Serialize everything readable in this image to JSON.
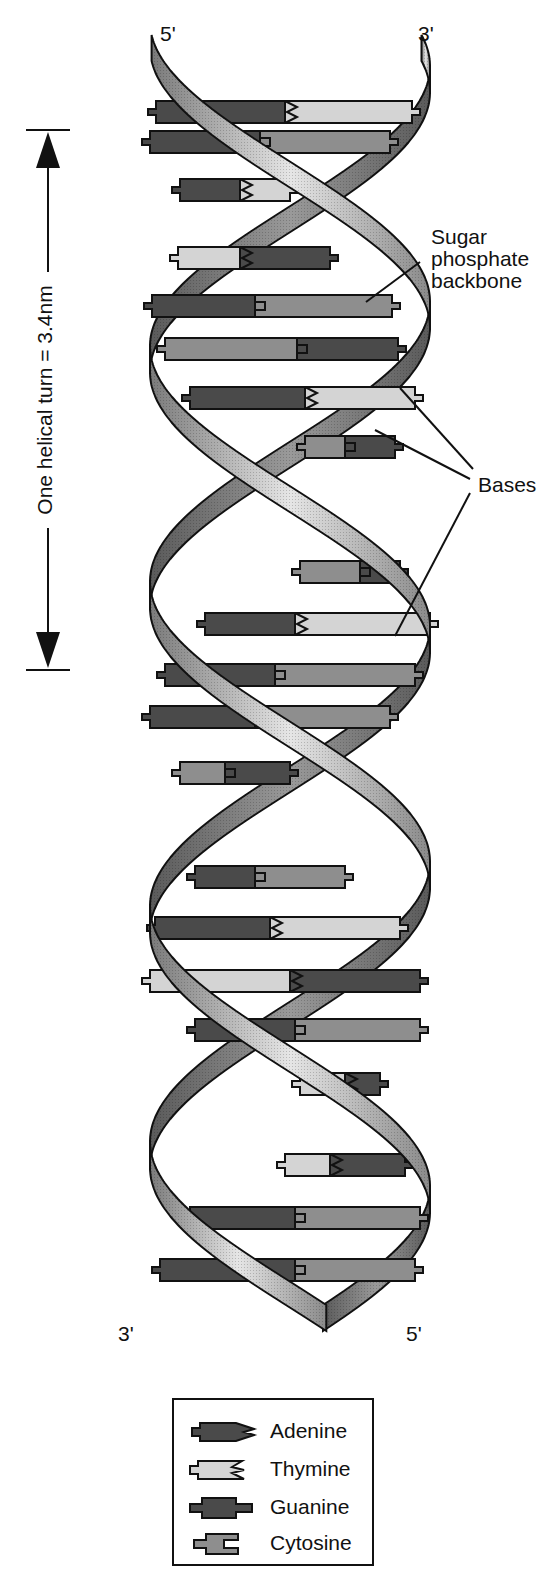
{
  "labels": {
    "top_left_end": "5'",
    "top_right_end": "3'",
    "bottom_left_end": "3'",
    "bottom_right_end": "5'",
    "helical_turn": "One helical turn = 3.4nm",
    "backbone_line1": "Sugar",
    "backbone_line2": "phosphate",
    "backbone_line3": "backbone",
    "bases": "Bases"
  },
  "legend": {
    "items": [
      {
        "name": "Adenine",
        "shape": "adenine"
      },
      {
        "name": "Thymine",
        "shape": "thymine"
      },
      {
        "name": "Guanine",
        "shape": "guanine"
      },
      {
        "name": "Cytosine",
        "shape": "cytosine"
      }
    ]
  },
  "colors": {
    "adenine": "#4a4a4a",
    "thymine": "#d4d4d4",
    "guanine": "#4a4a4a",
    "cytosine": "#8e8e8e",
    "strand_front": "#b9b9b9",
    "strand_back": "#6e6e6e",
    "outline": "#111111"
  },
  "helix": {
    "center_x": 290,
    "amplitude": 140,
    "top_y": 48,
    "bottom_y": 1318,
    "period": 560
  },
  "base_pairs": [
    {
      "y": 112,
      "x1": 156,
      "x2": 412,
      "left": "A",
      "right": "T",
      "split": 285
    },
    {
      "y": 142,
      "x1": 150,
      "x2": 390,
      "left": "G",
      "right": "C",
      "split": 260
    },
    {
      "y": 190,
      "x1": 180,
      "x2": 290,
      "left": "A",
      "right": "T",
      "split": 240
    },
    {
      "y": 258,
      "x1": 178,
      "x2": 330,
      "left": "T",
      "right": "A",
      "split": 240
    },
    {
      "y": 306,
      "x1": 152,
      "x2": 392,
      "left": "G",
      "right": "C",
      "split": 255
    },
    {
      "y": 349,
      "x1": 165,
      "x2": 398,
      "left": "C",
      "right": "G",
      "split": 297
    },
    {
      "y": 398,
      "x1": 190,
      "x2": 415,
      "left": "A",
      "right": "T",
      "split": 305
    },
    {
      "y": 447,
      "x1": 305,
      "x2": 395,
      "left": "C",
      "right": "G",
      "split": 345
    },
    {
      "y": 572,
      "x1": 300,
      "x2": 400,
      "left": "C",
      "right": "G",
      "split": 360
    },
    {
      "y": 624,
      "x1": 205,
      "x2": 430,
      "left": "A",
      "right": "T",
      "split": 295
    },
    {
      "y": 675,
      "x1": 165,
      "x2": 415,
      "left": "G",
      "right": "C",
      "split": 275
    },
    {
      "y": 717,
      "x1": 150,
      "x2": 390,
      "left": "G",
      "right": "C",
      "split": 255
    },
    {
      "y": 773,
      "x1": 180,
      "x2": 290,
      "left": "C",
      "right": "G",
      "split": 225
    },
    {
      "y": 877,
      "x1": 195,
      "x2": 345,
      "left": "G",
      "right": "C",
      "split": 255
    },
    {
      "y": 928,
      "x1": 155,
      "x2": 400,
      "left": "A",
      "right": "T",
      "split": 270
    },
    {
      "y": 981,
      "x1": 150,
      "x2": 420,
      "left": "T",
      "right": "A",
      "split": 290
    },
    {
      "y": 1030,
      "x1": 195,
      "x2": 420,
      "left": "G",
      "right": "C",
      "split": 295
    },
    {
      "y": 1084,
      "x1": 300,
      "x2": 380,
      "left": "T",
      "right": "A",
      "split": 345
    },
    {
      "y": 1165,
      "x1": 285,
      "x2": 405,
      "left": "T",
      "right": "A",
      "split": 330
    },
    {
      "y": 1218,
      "x1": 190,
      "x2": 420,
      "left": "G",
      "right": "C",
      "split": 295
    },
    {
      "y": 1270,
      "x1": 160,
      "x2": 415,
      "left": "G",
      "right": "C",
      "split": 295
    }
  ]
}
